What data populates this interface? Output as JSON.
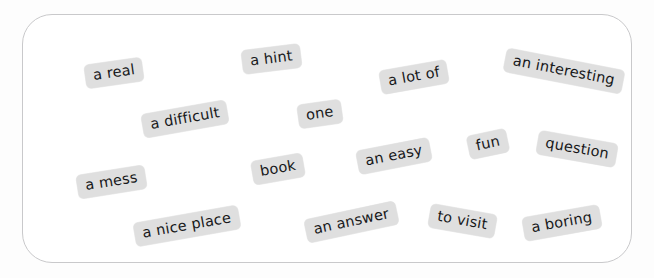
{
  "board": {
    "name": "word-bank-panel",
    "background_color": "#ffffff",
    "border_color": "#c9c9cb",
    "page_background_color": "#fcfcfc"
  },
  "chip_style": {
    "background_color": "#dfdfdf",
    "text_color": "#17181a",
    "font_size_px": 14.5,
    "corner_radius_px": 5
  },
  "chips": [
    {
      "label": "a real",
      "x": 62,
      "y": 46,
      "rotation": -8
    },
    {
      "label": "a hint",
      "x": 219,
      "y": 32,
      "rotation": -7
    },
    {
      "label": "a lot of",
      "x": 357,
      "y": 50,
      "rotation": -10
    },
    {
      "label": "an interesting",
      "x": 481,
      "y": 44,
      "rotation": 11
    },
    {
      "label": "a difficult",
      "x": 119,
      "y": 92,
      "rotation": -10
    },
    {
      "label": "one",
      "x": 275,
      "y": 87,
      "rotation": -8
    },
    {
      "label": "an easy",
      "x": 334,
      "y": 129,
      "rotation": -11
    },
    {
      "label": "fun",
      "x": 445,
      "y": 117,
      "rotation": -12
    },
    {
      "label": "question",
      "x": 514,
      "y": 122,
      "rotation": 10
    },
    {
      "label": "a mess",
      "x": 54,
      "y": 155,
      "rotation": -9
    },
    {
      "label": "book",
      "x": 229,
      "y": 142,
      "rotation": -10
    },
    {
      "label": "a nice place",
      "x": 111,
      "y": 199,
      "rotation": -10
    },
    {
      "label": "an answer",
      "x": 282,
      "y": 195,
      "rotation": -12
    },
    {
      "label": "to visit",
      "x": 406,
      "y": 194,
      "rotation": 10
    },
    {
      "label": "a boring",
      "x": 500,
      "y": 196,
      "rotation": -10
    }
  ]
}
